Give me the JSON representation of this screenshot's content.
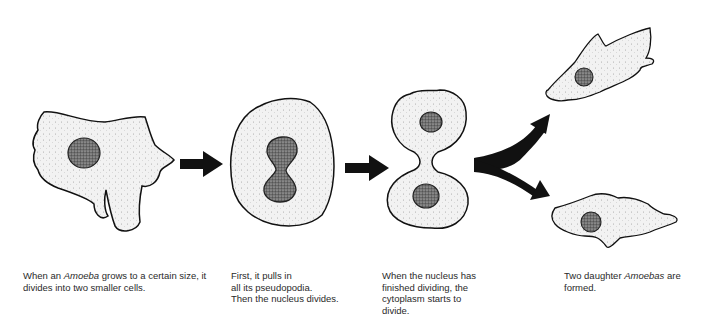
{
  "diagram": {
    "stages": [
      {
        "id": "stage-1",
        "illustration": "amoeba-with-pseudopodia",
        "caption": {
          "pre": "When an ",
          "italic": "Amoeba",
          "post": " grows to a certain size, it divides into two smaller cells."
        }
      },
      {
        "id": "stage-2",
        "illustration": "rounded-cell-dividing-nucleus",
        "caption": {
          "line1": "First, it pulls in",
          "line2": "all its pseudopodia.",
          "line3": "Then the nucleus divides."
        }
      },
      {
        "id": "stage-3",
        "illustration": "cytoplasm-pinching",
        "caption": {
          "line1": "When the nucleus has",
          "line2": "finished dividing, the",
          "line3": "cytoplasm starts to",
          "line4": "divide."
        }
      },
      {
        "id": "stage-4",
        "illustration": "two-daughter-amoebas",
        "caption": {
          "pre": "Two daughter ",
          "italic": "Amoebas",
          "post": " are formed."
        }
      }
    ],
    "arrows": [
      {
        "from": "stage-1",
        "to": "stage-2",
        "type": "straight"
      },
      {
        "from": "stage-2",
        "to": "stage-3",
        "type": "straight"
      },
      {
        "from": "stage-3",
        "to": "stage-4-top",
        "type": "curved-fork"
      },
      {
        "from": "stage-3",
        "to": "stage-4-bottom",
        "type": "curved-fork"
      }
    ],
    "colors": {
      "outline": "#111111",
      "cytoplasm": "#f0f0f0",
      "nucleus": "#555555",
      "arrow": "#111111",
      "text": "#2a2a2a"
    }
  }
}
